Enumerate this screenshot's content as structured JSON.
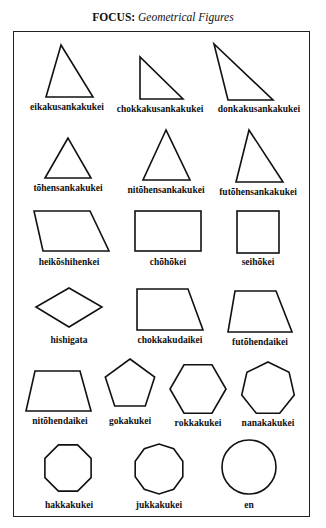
{
  "title": {
    "prefix": "FOCUS:",
    "subtitle": "Geometrical Figures"
  },
  "figures": [
    {
      "name": "eikakusankakukei",
      "shape": "acute-triangle"
    },
    {
      "name": "chokkakusankakukei",
      "shape": "right-triangle"
    },
    {
      "name": "donkakusankakukei",
      "shape": "obtuse-triangle"
    },
    {
      "name": "tōhensankakukei",
      "shape": "equilateral-triangle"
    },
    {
      "name": "nitōhensankakukei",
      "shape": "isosceles-triangle"
    },
    {
      "name": "futōhensankakukei",
      "shape": "scalene-triangle"
    },
    {
      "name": "heikōshihenkei",
      "shape": "parallelogram"
    },
    {
      "name": "chōhōkei",
      "shape": "rectangle"
    },
    {
      "name": "seihōkei",
      "shape": "square"
    },
    {
      "name": "hishigata",
      "shape": "rhombus"
    },
    {
      "name": "chokkakudaikei",
      "shape": "right-trapezoid"
    },
    {
      "name": "futōhendaikei",
      "shape": "scalene-trapezoid"
    },
    {
      "name": "nitōhendaikei",
      "shape": "isosceles-trapezoid"
    },
    {
      "name": "gokakukei",
      "shape": "pentagon"
    },
    {
      "name": "rokkakukei",
      "shape": "hexagon"
    },
    {
      "name": "nanakakukei",
      "shape": "heptagon"
    },
    {
      "name": "hakkakukei",
      "shape": "octagon"
    },
    {
      "name": "jukkakukei",
      "shape": "decagon"
    },
    {
      "name": "en",
      "shape": "circle"
    }
  ]
}
